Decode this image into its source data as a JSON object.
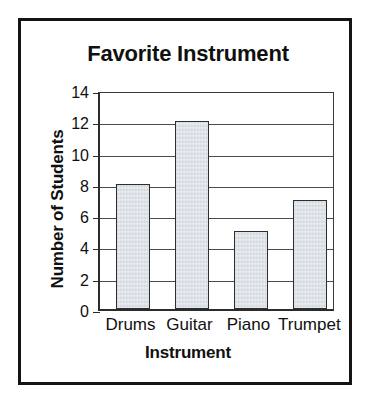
{
  "chart_data": {
    "type": "bar",
    "title": "Favorite Instrument",
    "xlabel": "Instrument",
    "ylabel": "Number of Students",
    "categories": [
      "Drums",
      "Guitar",
      "Piano",
      "Trumpet"
    ],
    "values": [
      8,
      12,
      5,
      7
    ],
    "ylim": [
      0,
      14
    ],
    "ytick_labels": [
      "0",
      "2",
      "4",
      "6",
      "8",
      "10",
      "12",
      "14"
    ],
    "ytick_values": [
      0,
      2,
      4,
      6,
      8,
      10,
      12,
      14
    ],
    "ytick_step": 2,
    "grid": "horizontal",
    "legend": "none",
    "bar_fill_color": "#dde2e8",
    "bar_border_color": "#2e2e2e",
    "axis_color": "#2b2b2b",
    "gridline_color": "#4a4a4a",
    "frame_color": "#141414",
    "background_color": "#ffffff",
    "text_color": "#101010"
  }
}
